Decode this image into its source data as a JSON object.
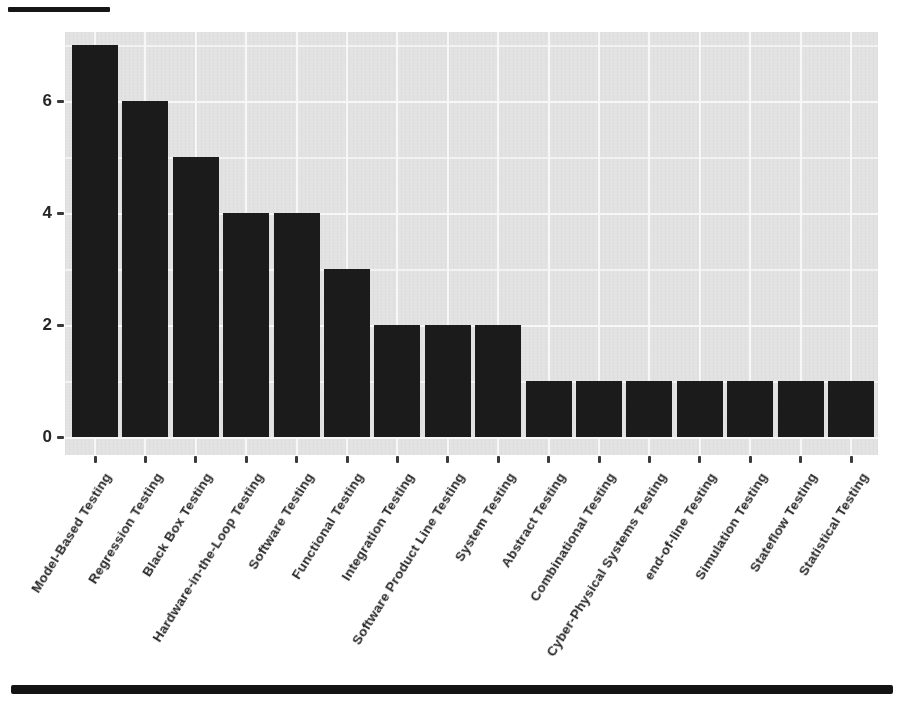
{
  "figure": {
    "top_rule_color": "#161616",
    "bottom_rule_color": "#141414"
  },
  "chart_data": {
    "type": "bar",
    "title": "",
    "subtitle": "",
    "xlabel": "",
    "ylabel": "",
    "categories": [
      "Model-Based Testing",
      "Regression Testing",
      "Black Box Testing",
      "Hardware-in-the-Loop Testing",
      "Software Testing",
      "Functional Testing",
      "Integration Testing",
      "Software Product Line Testing",
      "System Testing",
      "Abstract Testing",
      "Combinational Testing",
      "Cyber-Physical Systems Testing",
      "end-of-line Testing",
      "Simulation Testing",
      "Stateflow Testing",
      "Statistical Testing"
    ],
    "values": [
      7,
      6,
      5,
      4,
      4,
      3,
      2,
      2,
      2,
      1,
      1,
      1,
      1,
      1,
      1,
      1
    ],
    "ylim": [
      0,
      7.25
    ],
    "yticks": [
      0,
      2,
      4,
      6
    ],
    "minor_gridlines": [
      1,
      3,
      5,
      7
    ],
    "grid": true,
    "legend": "none",
    "x_tick_angle_deg": 58,
    "colors": {
      "bar": "#1b1b1b",
      "panel_background": "#e2e2e2",
      "gridline_major": "#f7f7f7",
      "gridline_minor": "#f2f2f2",
      "tick_text": "#262626",
      "tick_mark": "#3a3a3a"
    }
  }
}
